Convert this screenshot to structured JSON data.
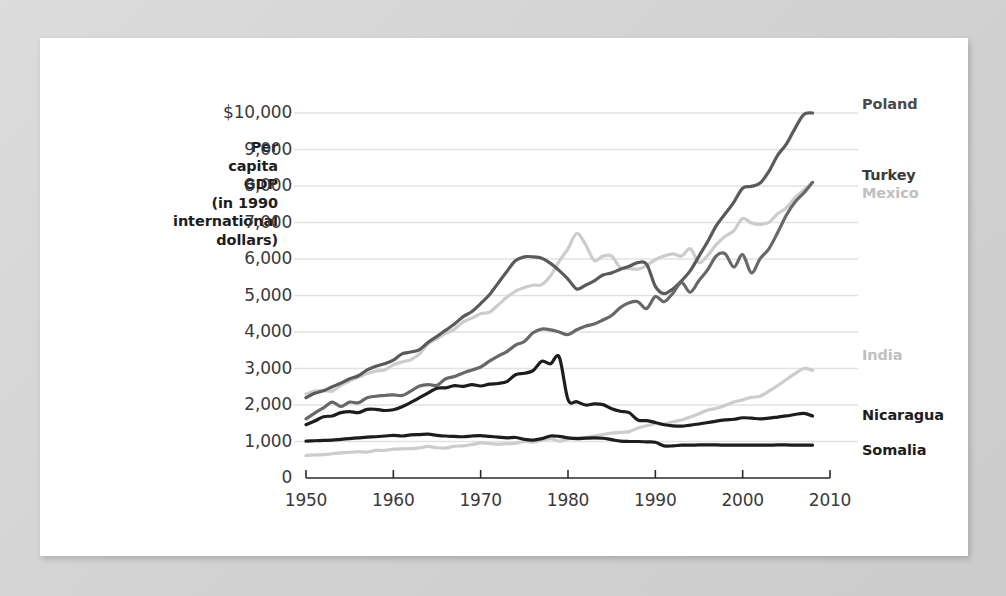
{
  "figure": {
    "background_color": "#d6d6d6",
    "card_color": "#ffffff",
    "axis_label_lines": [
      "Per",
      "capita",
      "GDP",
      "(in 1990",
      "international",
      "dollars)"
    ]
  },
  "chart_data": {
    "type": "line",
    "title": "",
    "xlabel": "",
    "ylabel": "Per capita GDP (in 1990 international dollars)",
    "xlim": [
      1950,
      2010
    ],
    "ylim": [
      0,
      10000
    ],
    "grid": true,
    "legend_position": "right-inline",
    "x_ticks": [
      "1950",
      "1960",
      "1970",
      "1980",
      "1990",
      "2000",
      "2010"
    ],
    "x_tick_values": [
      1950,
      1960,
      1970,
      1980,
      1990,
      2000,
      2010
    ],
    "y_ticks": [
      "0",
      "1,000",
      "2,000",
      "3,000",
      "4,000",
      "5,000",
      "6,000",
      "7,000",
      "8,000",
      "9,000",
      "$10,000"
    ],
    "y_tick_values": [
      0,
      1000,
      2000,
      3000,
      4000,
      5000,
      6000,
      7000,
      8000,
      9000,
      10000
    ],
    "x": [
      1950,
      1951,
      1952,
      1953,
      1954,
      1955,
      1956,
      1957,
      1958,
      1959,
      1960,
      1961,
      1962,
      1963,
      1964,
      1965,
      1966,
      1967,
      1968,
      1969,
      1970,
      1971,
      1972,
      1973,
      1974,
      1975,
      1976,
      1977,
      1978,
      1979,
      1980,
      1981,
      1982,
      1983,
      1984,
      1985,
      1986,
      1987,
      1988,
      1989,
      1990,
      1991,
      1992,
      1993,
      1994,
      1995,
      1996,
      1997,
      1998,
      1999,
      2000,
      2001,
      2002,
      2003,
      2004,
      2005,
      2006,
      2007,
      2008
    ],
    "series": [
      {
        "name": "Poland",
        "color": "#5a5a5a",
        "label_color": "#4a4a4a",
        "values": [
          2200,
          2320,
          2390,
          2500,
          2600,
          2720,
          2800,
          2960,
          3060,
          3130,
          3230,
          3400,
          3450,
          3520,
          3720,
          3880,
          4050,
          4220,
          4420,
          4560,
          4780,
          5020,
          5340,
          5660,
          5960,
          6060,
          6060,
          6020,
          5880,
          5680,
          5450,
          5180,
          5280,
          5400,
          5560,
          5620,
          5720,
          5800,
          5900,
          5860,
          5250,
          5050,
          5180,
          5400,
          5680,
          6080,
          6480,
          6920,
          7240,
          7560,
          7940,
          7990,
          8080,
          8400,
          8840,
          9150,
          9580,
          9960,
          10000
        ]
      },
      {
        "name": "Turkey",
        "color": "#686868",
        "label_color": "#3a3a3a",
        "values": [
          1620,
          1780,
          1920,
          2080,
          1960,
          2080,
          2060,
          2200,
          2240,
          2260,
          2280,
          2260,
          2380,
          2520,
          2560,
          2540,
          2720,
          2780,
          2880,
          2960,
          3040,
          3200,
          3340,
          3460,
          3640,
          3740,
          3980,
          4080,
          4060,
          4000,
          3930,
          4060,
          4160,
          4220,
          4330,
          4450,
          4670,
          4800,
          4830,
          4640,
          4970,
          4830,
          5060,
          5350,
          5090,
          5410,
          5710,
          6090,
          6140,
          5780,
          6120,
          5620,
          6010,
          6280,
          6720,
          7200,
          7560,
          7810,
          8100
        ]
      },
      {
        "name": "Mexico",
        "color": "#cccccc",
        "label_color": "#c0c0c0",
        "values": [
          2300,
          2380,
          2400,
          2380,
          2540,
          2660,
          2760,
          2860,
          2930,
          2960,
          3100,
          3180,
          3240,
          3400,
          3680,
          3820,
          3960,
          4080,
          4280,
          4380,
          4500,
          4540,
          4740,
          4950,
          5120,
          5220,
          5280,
          5300,
          5540,
          5940,
          6280,
          6700,
          6400,
          5960,
          6080,
          6080,
          5760,
          5740,
          5720,
          5820,
          5980,
          6080,
          6140,
          6080,
          6280,
          5900,
          6100,
          6400,
          6620,
          6780,
          7110,
          6990,
          6950,
          7000,
          7240,
          7400,
          7680,
          7890,
          8100
        ]
      },
      {
        "name": "India",
        "color": "#cccccc",
        "label_color": "#c0c0c0",
        "values": [
          620,
          630,
          640,
          665,
          690,
          700,
          725,
          710,
          755,
          755,
          790,
          800,
          805,
          825,
          865,
          830,
          820,
          870,
          880,
          915,
          960,
          945,
          925,
          940,
          950,
          1000,
          985,
          1035,
          1080,
          1010,
          1070,
          1100,
          1110,
          1150,
          1190,
          1230,
          1250,
          1270,
          1370,
          1430,
          1490,
          1480,
          1540,
          1590,
          1670,
          1760,
          1860,
          1910,
          1990,
          2080,
          2140,
          2210,
          2240,
          2380,
          2530,
          2700,
          2860,
          3000,
          2950
        ]
      },
      {
        "name": "Nicaragua",
        "color": "#1d1d1d",
        "label_color": "#1d1d1d",
        "values": [
          1460,
          1560,
          1680,
          1700,
          1790,
          1820,
          1790,
          1880,
          1880,
          1850,
          1870,
          1950,
          2070,
          2200,
          2330,
          2460,
          2470,
          2530,
          2510,
          2560,
          2520,
          2570,
          2590,
          2640,
          2830,
          2870,
          2940,
          3200,
          3130,
          3310,
          2150,
          2090,
          2000,
          2030,
          2010,
          1900,
          1830,
          1790,
          1590,
          1570,
          1520,
          1460,
          1430,
          1420,
          1450,
          1480,
          1520,
          1560,
          1590,
          1610,
          1650,
          1640,
          1620,
          1640,
          1670,
          1700,
          1740,
          1770,
          1700
        ]
      },
      {
        "name": "Somalia",
        "color": "#1d1d1d",
        "label_color": "#1d1d1d",
        "values": [
          1010,
          1020,
          1030,
          1040,
          1060,
          1080,
          1100,
          1120,
          1130,
          1150,
          1170,
          1150,
          1180,
          1190,
          1200,
          1170,
          1150,
          1140,
          1130,
          1150,
          1160,
          1140,
          1120,
          1100,
          1110,
          1060,
          1040,
          1080,
          1150,
          1140,
          1100,
          1080,
          1090,
          1100,
          1090,
          1050,
          1010,
          1000,
          1000,
          990,
          980,
          880,
          880,
          900,
          900,
          905,
          905,
          905,
          900,
          900,
          900,
          900,
          900,
          900,
          905,
          905,
          900,
          900,
          900
        ]
      }
    ]
  },
  "series_labels": [
    {
      "name": "Poland",
      "text": "Poland"
    },
    {
      "name": "Turkey",
      "text": "Turkey"
    },
    {
      "name": "Mexico",
      "text": "Mexico"
    },
    {
      "name": "India",
      "text": "India"
    },
    {
      "name": "Nicaragua",
      "text": "Nicaragua"
    },
    {
      "name": "Somalia",
      "text": "Somalia"
    }
  ]
}
